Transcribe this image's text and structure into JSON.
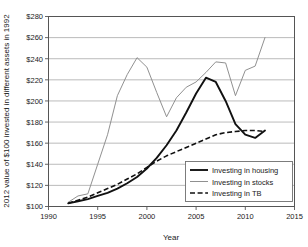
{
  "chart_data": {
    "type": "line",
    "title": "",
    "xlabel": "Year",
    "ylabel": "2012 value of $100 invested in different assets in 1992",
    "xlim": [
      1990,
      2015
    ],
    "ylim": [
      100,
      280
    ],
    "xticks": [
      1990,
      1995,
      2000,
      2005,
      2010,
      2015
    ],
    "xticklabels": [
      "1990",
      "1995",
      "2000",
      "2005",
      "2010",
      "2015"
    ],
    "yticks": [
      100,
      120,
      140,
      160,
      180,
      200,
      220,
      240,
      260,
      280
    ],
    "yticklabels": [
      "$100",
      "$120",
      "$140",
      "$160",
      "$180",
      "$200",
      "$220",
      "$240",
      "$260",
      "$280"
    ],
    "grid": "horizontal",
    "legend_position": "lower right",
    "x": [
      1992,
      1993,
      1994,
      1995,
      1996,
      1997,
      1998,
      1999,
      2000,
      2001,
      2002,
      2003,
      2004,
      2005,
      2006,
      2007,
      2008,
      2009,
      2010,
      2011,
      2012
    ],
    "series": [
      {
        "name": "Investing in housing",
        "style": "solid-bold-black",
        "color": "#111111",
        "values": [
          103,
          105,
          107,
          110,
          113,
          117,
          122,
          128,
          136,
          146,
          158,
          172,
          189,
          207,
          222,
          218,
          200,
          178,
          168,
          165,
          172
        ]
      },
      {
        "name": "Investing in stocks",
        "style": "solid-thin-gray",
        "color": "#8a8a8a",
        "values": [
          104,
          110,
          112,
          140,
          168,
          205,
          225,
          241,
          232,
          208,
          185,
          203,
          213,
          218,
          227,
          237,
          236,
          205,
          229,
          233,
          260
        ]
      },
      {
        "name": "Investing in TB",
        "style": "dashed-black",
        "color": "#111111",
        "values": [
          103,
          106,
          109,
          113,
          117,
          121,
          126,
          131,
          137,
          143,
          148,
          152,
          156,
          160,
          164,
          168,
          170,
          171,
          172,
          172,
          171
        ]
      }
    ]
  },
  "legend": {
    "items": [
      {
        "label": "Investing in housing"
      },
      {
        "label": "Investing in stocks"
      },
      {
        "label": "Investing in TB"
      }
    ]
  }
}
